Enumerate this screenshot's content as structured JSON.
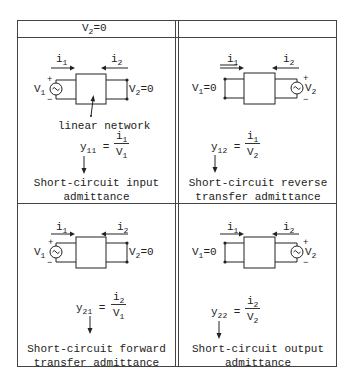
{
  "header": {
    "left": "V2=0",
    "left_main": "V",
    "left_sub": "2",
    "left_rest": "=0",
    "right": ""
  },
  "cells": [
    {
      "id": "y11",
      "i1": {
        "main": "i",
        "sub": "1"
      },
      "i2": {
        "main": "i",
        "sub": "2"
      },
      "left_label": {
        "main": "V",
        "sub": "1",
        "rest": ""
      },
      "right_label": {
        "main": "V",
        "sub": "2",
        "rest": "=0"
      },
      "network_label": "linear network",
      "param": {
        "main": "y",
        "sub": "11"
      },
      "num": {
        "main": "i",
        "sub": "1"
      },
      "den": {
        "main": "V",
        "sub": "1"
      },
      "desc_line1": "Short-circuit input",
      "desc_line2": "admittance"
    },
    {
      "id": "y12",
      "i1": {
        "main": "i",
        "sub": "1"
      },
      "i2": {
        "main": "i",
        "sub": "2"
      },
      "left_label": {
        "main": "V",
        "sub": "1",
        "rest": "=0"
      },
      "right_label": {
        "main": "V",
        "sub": "2",
        "rest": ""
      },
      "param": {
        "main": "y",
        "sub": "12"
      },
      "num": {
        "main": "i",
        "sub": "1"
      },
      "den": {
        "main": "V",
        "sub": "2"
      },
      "desc_line1": "Short-circuit reverse",
      "desc_line2": "transfer admittance"
    },
    {
      "id": "y21",
      "i1": {
        "main": "i",
        "sub": "1"
      },
      "i2": {
        "main": "i",
        "sub": "2"
      },
      "left_label": {
        "main": "V",
        "sub": "1",
        "rest": ""
      },
      "right_label": {
        "main": "V",
        "sub": "2",
        "rest": "=0"
      },
      "param": {
        "main": "y",
        "sub": "21"
      },
      "num": {
        "main": "i",
        "sub": "2"
      },
      "den": {
        "main": "V",
        "sub": "1"
      },
      "desc_line1": "Short-circuit forward",
      "desc_line2": "transfer admittance"
    },
    {
      "id": "y22",
      "i1": {
        "main": "i",
        "sub": "1"
      },
      "i2": {
        "main": "i",
        "sub": "2"
      },
      "left_label": {
        "main": "V",
        "sub": "1",
        "rest": "=0"
      },
      "right_label": {
        "main": "V",
        "sub": "2",
        "rest": ""
      },
      "param": {
        "main": "y",
        "sub": "22"
      },
      "num": {
        "main": "i",
        "sub": "2"
      },
      "den": {
        "main": "V",
        "sub": "2"
      },
      "desc_line1": "Short-circuit output",
      "desc_line2": "admittance"
    }
  ],
  "symbols": {
    "plus": "+",
    "minus": "−",
    "equals": "="
  }
}
